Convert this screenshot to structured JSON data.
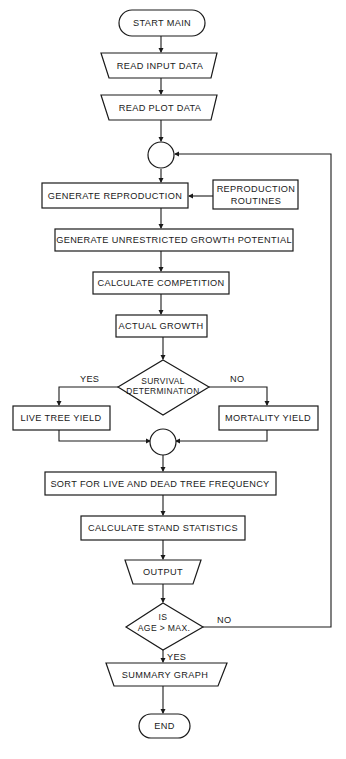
{
  "diagram": {
    "type": "flowchart",
    "nodes": {
      "start": {
        "shape": "terminator",
        "label": "START MAIN"
      },
      "read_input": {
        "shape": "manual-input",
        "label": "READ INPUT DATA"
      },
      "read_plot": {
        "shape": "manual-input",
        "label": "READ PLOT DATA"
      },
      "connector_loop": {
        "shape": "connector",
        "label": ""
      },
      "generate_reproduction": {
        "shape": "process",
        "label": "GENERATE REPRODUCTION"
      },
      "reproduction_routines": {
        "shape": "process",
        "label_line1": "REPRODUCTION",
        "label_line2": "ROUTINES"
      },
      "generate_growth": {
        "shape": "process",
        "label": "GENERATE UNRESTRICTED GROWTH POTENTIAL"
      },
      "calculate_competition": {
        "shape": "process",
        "label": "CALCULATE COMPETITION"
      },
      "actual_growth": {
        "shape": "process",
        "label": "ACTUAL GROWTH"
      },
      "survival_decision": {
        "shape": "decision",
        "label_line1": "SURVIVAL",
        "label_line2": "DETERMINATION"
      },
      "live_tree_yield": {
        "shape": "process",
        "label": "LIVE TREE YIELD"
      },
      "mortality_yield": {
        "shape": "process",
        "label": "MORTALITY YIELD"
      },
      "connector_merge": {
        "shape": "connector",
        "label": ""
      },
      "sort_frequency": {
        "shape": "process",
        "label": "SORT FOR LIVE AND DEAD TREE FREQUENCY"
      },
      "stand_statistics": {
        "shape": "process",
        "label": "CALCULATE STAND STATISTICS"
      },
      "output": {
        "shape": "manual-operation",
        "label": "OUTPUT"
      },
      "age_decision": {
        "shape": "decision",
        "label_line1": "IS",
        "label_line2": "AGE > MAX."
      },
      "summary_graph": {
        "shape": "manual-operation",
        "label": "SUMMARY GRAPH"
      },
      "end": {
        "shape": "terminator",
        "label": "END"
      }
    },
    "edge_labels": {
      "survival_yes": "YES",
      "survival_no": "NO",
      "age_no": "NO",
      "age_yes": "YES"
    },
    "edges": [
      {
        "from": "start",
        "to": "read_input"
      },
      {
        "from": "read_input",
        "to": "read_plot"
      },
      {
        "from": "read_plot",
        "to": "connector_loop"
      },
      {
        "from": "connector_loop",
        "to": "generate_reproduction"
      },
      {
        "from": "reproduction_routines",
        "to": "generate_reproduction"
      },
      {
        "from": "generate_reproduction",
        "to": "generate_growth"
      },
      {
        "from": "generate_growth",
        "to": "calculate_competition"
      },
      {
        "from": "calculate_competition",
        "to": "actual_growth"
      },
      {
        "from": "actual_growth",
        "to": "survival_decision"
      },
      {
        "from": "survival_decision",
        "to": "live_tree_yield",
        "label": "YES"
      },
      {
        "from": "survival_decision",
        "to": "mortality_yield",
        "label": "NO"
      },
      {
        "from": "live_tree_yield",
        "to": "connector_merge"
      },
      {
        "from": "mortality_yield",
        "to": "connector_merge"
      },
      {
        "from": "connector_merge",
        "to": "sort_frequency"
      },
      {
        "from": "sort_frequency",
        "to": "stand_statistics"
      },
      {
        "from": "stand_statistics",
        "to": "output"
      },
      {
        "from": "output",
        "to": "age_decision"
      },
      {
        "from": "age_decision",
        "to": "connector_loop",
        "label": "NO"
      },
      {
        "from": "age_decision",
        "to": "summary_graph",
        "label": "YES"
      },
      {
        "from": "summary_graph",
        "to": "end"
      }
    ],
    "colors": {
      "stroke": "#1a1a1a",
      "background": "#ffffff"
    }
  }
}
